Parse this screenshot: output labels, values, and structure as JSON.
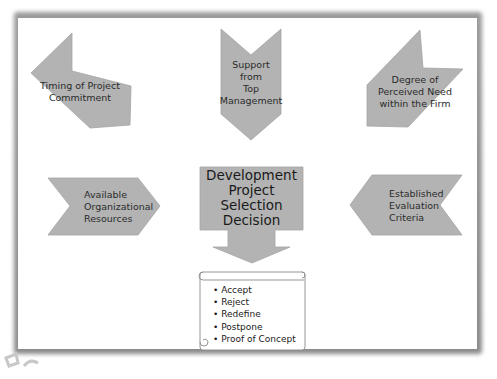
{
  "diagram": {
    "title": "Development Project Selection Decision",
    "center_box": {
      "label": "Development\nProject\nSelection\nDecision"
    },
    "factors": [
      {
        "id": "timing",
        "label": "Timing of Project\nCommitment",
        "direction": "down-right"
      },
      {
        "id": "support",
        "label": "Support\nfrom\nTop\nManagement",
        "direction": "down"
      },
      {
        "id": "need",
        "label": "Degree of\nPerceived Need\nwithin the Firm",
        "direction": "down-left"
      },
      {
        "id": "resources",
        "label": "Available\nOrganizational\nResources",
        "direction": "right"
      },
      {
        "id": "criteria",
        "label": "Established\nEvaluation\nCriteria",
        "direction": "left"
      }
    ],
    "outcomes": [
      "Accept",
      "Reject",
      "Redefine",
      "Postpone",
      "Proof of Concept"
    ],
    "colors": {
      "shape_fill": "#b3b3b3",
      "shape_stroke": "#9e9e9e",
      "text": "#2b2b2b",
      "frame_shadow": "#8f8f8f",
      "background": "#ffffff"
    }
  }
}
